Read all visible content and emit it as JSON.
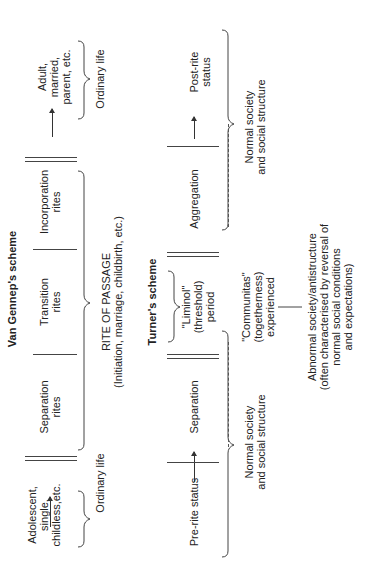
{
  "van_gennep": {
    "title": "Van Gennep's scheme",
    "start_state": "Adolescent,\nsingle,\nchildless,etc.",
    "phases": [
      "Separation\nrites",
      "Transition\nrites",
      "Incorporation\nrites"
    ],
    "end_state": "Adult,\nmarried,\nparent, etc.",
    "ordinary_life_left": "Ordinary life",
    "ordinary_life_right": "Ordinary life",
    "rite_of_passage": "RITE OF PASSAGE\n(Initiation, marriage, childbirth, etc.)"
  },
  "turner": {
    "title": "Turner's scheme",
    "start_state": "Pre-rite status",
    "phases": [
      "Separation",
      "\"Liminol\"\n(threshold)\nperiod",
      "Aggregation"
    ],
    "end_state": "Post-rite status",
    "communitas": "\"Communitas\"\n(togetherness)\nexperienced",
    "normal_left": "Normal society\nand social structure",
    "normal_right": "Normal society\nand social structure",
    "abnormal": "Abnormal society/antistructure\n(often characterised by reversal of\nnormal social conditions\nand expectations)"
  }
}
